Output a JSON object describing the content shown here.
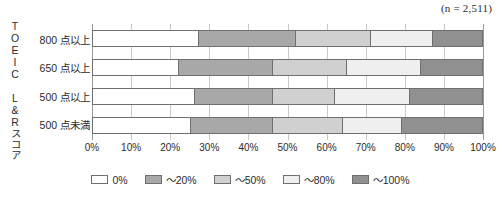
{
  "sample_note": "(n = 2,511)",
  "axis": {
    "y_title": "TOEIC L&Rスコア",
    "x_ticks": [
      "0%",
      "10%",
      "20%",
      "30%",
      "40%",
      "50%",
      "60%",
      "70%",
      "80%",
      "90%",
      "100%"
    ]
  },
  "legend": {
    "items": [
      {
        "label": "0%",
        "color": "#ffffff"
      },
      {
        "label": "～20%",
        "color": "#a8a8a8"
      },
      {
        "label": "～50%",
        "color": "#d0d0d0"
      },
      {
        "label": "～80%",
        "color": "#efefef"
      },
      {
        "label": "～100%",
        "color": "#909090"
      }
    ]
  },
  "chart_data": {
    "type": "bar",
    "orientation": "horizontal",
    "stacked": true,
    "stack_total": 100,
    "title": "",
    "subtitle": "",
    "annotations": [
      "(n = 2,511)"
    ],
    "xlabel": "",
    "ylabel": "TOEIC L&Rスコア",
    "xlim": [
      0,
      100
    ],
    "x_tick_values": [
      0,
      10,
      20,
      30,
      40,
      50,
      60,
      70,
      80,
      90,
      100
    ],
    "x_tick_labels": [
      "0%",
      "10%",
      "20%",
      "30%",
      "40%",
      "50%",
      "60%",
      "70%",
      "80%",
      "90%",
      "100%"
    ],
    "grid": true,
    "legend_position": "bottom",
    "categories": [
      "800 点以上",
      "650 点以上",
      "500 点以上",
      "500 点未満"
    ],
    "series": [
      {
        "name": "0%",
        "color": "#ffffff",
        "values": [
          27,
          22,
          26,
          25
        ]
      },
      {
        "name": "～20%",
        "color": "#a8a8a8",
        "values": [
          25,
          24,
          20,
          21
        ]
      },
      {
        "name": "～50%",
        "color": "#d0d0d0",
        "values": [
          19,
          19,
          16,
          18
        ]
      },
      {
        "name": "～80%",
        "color": "#efefef",
        "values": [
          16,
          19,
          19,
          15
        ]
      },
      {
        "name": "～100%",
        "color": "#909090",
        "values": [
          13,
          16,
          19,
          21
        ]
      }
    ],
    "cumulative_boundaries": [
      [
        27,
        52,
        71,
        87,
        100
      ],
      [
        22,
        46,
        65,
        84,
        100
      ],
      [
        26,
        46,
        62,
        81,
        100
      ],
      [
        25,
        46,
        64,
        79,
        100
      ]
    ]
  }
}
